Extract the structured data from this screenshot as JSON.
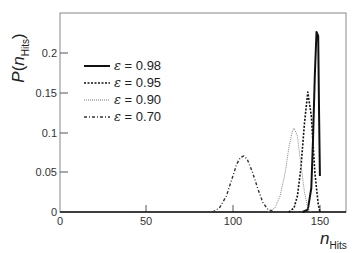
{
  "chart_data": {
    "type": "line",
    "title": "",
    "xlabel": "n_Hits",
    "ylabel": "P(n_Hits)",
    "xlim": [
      0,
      165
    ],
    "ylim": [
      0,
      0.25
    ],
    "xticks": [
      0,
      50,
      100,
      150
    ],
    "yticks": [
      0,
      0.05,
      0.1,
      0.15,
      0.2
    ],
    "xtick_labels": [
      "0",
      "50",
      "100",
      "150"
    ],
    "ytick_labels": [
      "0",
      "0.05",
      "0.1",
      "0.15",
      "0.2"
    ],
    "grid": false,
    "legend_position": "upper left",
    "series": [
      {
        "name": "ε = 0.98",
        "style": "solid",
        "x": [
          140,
          143,
          145,
          146,
          147,
          148,
          149,
          149.5,
          150
        ],
        "y": [
          0,
          0.003,
          0.03,
          0.09,
          0.17,
          0.225,
          0.22,
          0.12,
          0.045
        ]
      },
      {
        "name": "ε = 0.95",
        "style": "dashed",
        "x": [
          132,
          135,
          137,
          139,
          141,
          143,
          145,
          147,
          149,
          150
        ],
        "y": [
          0,
          0.005,
          0.02,
          0.055,
          0.11,
          0.15,
          0.12,
          0.05,
          0.01,
          0
        ]
      },
      {
        "name": "ε = 0.90",
        "style": "dotted",
        "x": [
          120,
          124,
          127,
          130,
          132,
          134,
          135,
          137,
          139,
          141,
          143,
          145
        ],
        "y": [
          0,
          0.005,
          0.02,
          0.05,
          0.08,
          0.1,
          0.105,
          0.095,
          0.06,
          0.025,
          0.005,
          0
        ]
      },
      {
        "name": "ε = 0.70",
        "style": "dashdot",
        "x": [
          88,
          92,
          96,
          99,
          102,
          104,
          106,
          108,
          111,
          114,
          117,
          120,
          124
        ],
        "y": [
          0,
          0.005,
          0.02,
          0.04,
          0.06,
          0.068,
          0.07,
          0.066,
          0.05,
          0.03,
          0.012,
          0.003,
          0
        ]
      }
    ]
  },
  "axes": {
    "ylabel_main": "P(",
    "ylabel_var": "n",
    "ylabel_sub": "Hits",
    "ylabel_close": ")",
    "xlabel_var": "n",
    "xlabel_sub": "Hits"
  },
  "legend": [
    {
      "symbol": "ε",
      "label": " = 0.98"
    },
    {
      "symbol": "ε",
      "label": " = 0.95"
    },
    {
      "symbol": "ε",
      "label": " = 0.90"
    },
    {
      "symbol": "ε",
      "label": " = 0.70"
    }
  ],
  "ticks": {
    "x": [
      "0",
      "50",
      "100",
      "150"
    ],
    "y": [
      "0",
      "0.05",
      "0.1",
      "0.15",
      "0.2"
    ]
  }
}
